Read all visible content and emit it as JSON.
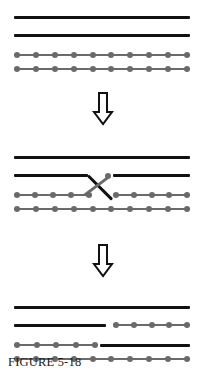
{
  "figure": {
    "caption": "FIGURE 5-18",
    "colors": {
      "dark_chromatid": "#111111",
      "light_chromatid": "#6a6a6a",
      "bead": "#6a6a6a",
      "background": "#ffffff"
    },
    "arrow_icon": "down-arrow-outline",
    "panels": [
      {
        "name": "stage-1-paired-homologs",
        "label": "Paired homologous chromosomes before crossing over",
        "rows": [
          {
            "name": "chromatid-1",
            "type": "dark",
            "segments": [
              {
                "x": 14,
                "width": 176
              }
            ]
          },
          {
            "name": "chromatid-2",
            "type": "dark",
            "segments": [
              {
                "x": 14,
                "width": 176
              }
            ]
          },
          {
            "name": "chromatid-3",
            "type": "beaded",
            "segments": [
              {
                "x": 14,
                "width": 176,
                "beads": 10
              }
            ]
          },
          {
            "name": "chromatid-4",
            "type": "beaded",
            "segments": [
              {
                "x": 14,
                "width": 176,
                "beads": 10
              }
            ]
          }
        ]
      },
      {
        "name": "stage-2-chiasma-crossover",
        "label": "Chiasma forms; inner chromatids break and exchange segments",
        "rows": [
          {
            "name": "chromatid-1",
            "type": "dark",
            "segments": [
              {
                "x": 14,
                "width": 176
              }
            ]
          },
          {
            "name": "chromatid-2",
            "type": "dark",
            "segments": [
              {
                "x": 14,
                "width": 74
              },
              {
                "x": 113,
                "width": 77
              }
            ]
          },
          {
            "name": "chromatid-3",
            "type": "beaded",
            "segments": [
              {
                "x": 14,
                "width": 78,
                "beads": 5
              },
              {
                "x": 113,
                "width": 77,
                "beads": 5
              }
            ]
          },
          {
            "name": "chromatid-4",
            "type": "beaded",
            "segments": [
              {
                "x": 14,
                "width": 176,
                "beads": 10
              }
            ]
          }
        ],
        "crossover": {
          "name": "chiasma-cross",
          "x": 88,
          "y_top": 170,
          "y_bottom": 188
        }
      },
      {
        "name": "stage-3-recombinant-chromatids",
        "label": "Recombinant chromatids after exchange",
        "rows": [
          {
            "name": "chromatid-1",
            "type": "dark",
            "segments": [
              {
                "x": 14,
                "width": 176
              }
            ]
          },
          {
            "name": "chromatid-2",
            "type": "mixed-dark-then-beaded",
            "segments": [
              {
                "x": 14,
                "width": 92,
                "kind": "dark"
              },
              {
                "x": 113,
                "width": 77,
                "kind": "beaded",
                "beads": 5
              }
            ]
          },
          {
            "name": "chromatid-3",
            "type": "mixed-beaded-then-dark",
            "segments": [
              {
                "x": 14,
                "width": 84,
                "kind": "beaded",
                "beads": 5
              },
              {
                "x": 100,
                "width": 90,
                "kind": "dark"
              }
            ]
          },
          {
            "name": "chromatid-4",
            "type": "beaded",
            "segments": [
              {
                "x": 14,
                "width": 176,
                "beads": 10
              }
            ]
          }
        ]
      }
    ]
  }
}
